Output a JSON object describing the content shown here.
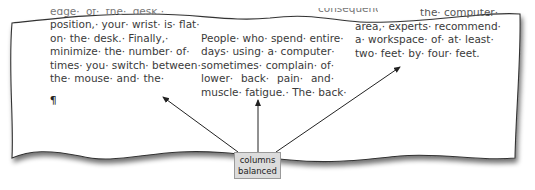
{
  "figure": {
    "type": "word-document-excerpt"
  },
  "columns": [
    {
      "clipped_top": "edge· of· the· desk.·",
      "lines": [
        "position,· your· wrist· is· flat·",
        "on· the· desk.· Finally,·",
        "minimize· the· number· of·",
        "times· you· switch· between·",
        "the· mouse· and· the·"
      ]
    },
    {
      "clipped_top": "consequence",
      "lines": [
        "People· who· spend· entire·",
        "days· using· a· computer·",
        "sometimes· complain· of·",
        "lower· back· pain· and·",
        "muscle· fatigue.· The· back·"
      ]
    },
    {
      "clipped_top": "the· computer·",
      "lines": [
        "area,· experts· recommend·",
        "a· workspace· of· at· least·",
        "two· feet· by· four· feet."
      ]
    }
  ],
  "cursor_mark": "¶",
  "callout": {
    "line1": "columns",
    "line2": "balanced"
  },
  "colors": {
    "text": "#3a3a3a",
    "callout_bg": "#dcdcdc",
    "callout_border": "#9a9a9a",
    "arrow": "#222222",
    "page_edge": "#333333"
  }
}
